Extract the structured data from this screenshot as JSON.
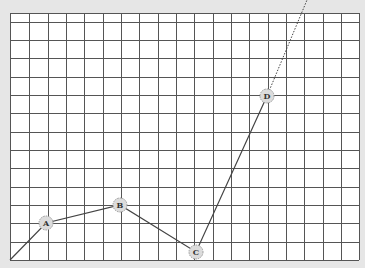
{
  "diagram": {
    "background": "#e6e6e6",
    "grid": {
      "left": 10,
      "right": 359,
      "top": 13,
      "bottom": 260,
      "columns_x": [
        10,
        29,
        48,
        66,
        84,
        103,
        121,
        139,
        158,
        176,
        194,
        213,
        231,
        249,
        268,
        286,
        304,
        323,
        341,
        359
      ],
      "rows_y": [
        13,
        22,
        40,
        58,
        77,
        95,
        113,
        132,
        150,
        168,
        187,
        205,
        223,
        242,
        260
      ],
      "fill": "#ffffff",
      "line_color": "#555555"
    },
    "path": {
      "start": [
        10,
        260
      ],
      "solid_end": [
        267,
        96
      ],
      "dotted_end": [
        307,
        0
      ],
      "color": "#444444"
    },
    "points": [
      {
        "label": "A",
        "x": 46,
        "y": 223
      },
      {
        "label": "B",
        "x": 120,
        "y": 205
      },
      {
        "label": "C",
        "x": 196,
        "y": 252
      },
      {
        "label": "D",
        "x": 267,
        "y": 96
      }
    ]
  }
}
